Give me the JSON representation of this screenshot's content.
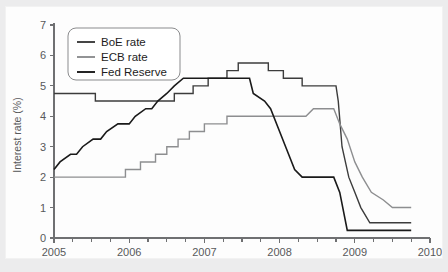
{
  "chart_data": {
    "type": "line",
    "title": "",
    "subtitle": "",
    "xlabel": "",
    "ylabel": "Interest rate (%)",
    "xlim": [
      2005,
      2010
    ],
    "ylim": [
      0,
      7
    ],
    "grid": false,
    "legend_position": "top-left",
    "x_tick_labels": [
      "2005",
      "2006",
      "2007",
      "2008",
      "2009",
      "2010"
    ],
    "x_tick_values": [
      2005,
      2006,
      2007,
      2008,
      2009,
      2010
    ],
    "x_minor_tick_interval": 0.25,
    "y_tick_labels": [
      "0",
      "1",
      "2",
      "3",
      "4",
      "5",
      "6",
      "7"
    ],
    "y_tick_values": [
      0,
      1,
      2,
      3,
      4,
      5,
      6,
      7
    ],
    "series": [
      {
        "name": "BoE rate",
        "color": "#3c3c3c",
        "width": 1.4,
        "points": [
          [
            2005.0,
            4.75
          ],
          [
            2005.55,
            4.75
          ],
          [
            2005.55,
            4.5
          ],
          [
            2006.6,
            4.5
          ],
          [
            2006.6,
            4.75
          ],
          [
            2006.85,
            4.75
          ],
          [
            2006.85,
            5.0
          ],
          [
            2007.05,
            5.0
          ],
          [
            2007.05,
            5.25
          ],
          [
            2007.3,
            5.25
          ],
          [
            2007.3,
            5.5
          ],
          [
            2007.45,
            5.5
          ],
          [
            2007.45,
            5.75
          ],
          [
            2007.85,
            5.75
          ],
          [
            2007.85,
            5.5
          ],
          [
            2008.05,
            5.5
          ],
          [
            2008.05,
            5.25
          ],
          [
            2008.3,
            5.25
          ],
          [
            2008.3,
            5.0
          ],
          [
            2008.75,
            5.0
          ],
          [
            2008.78,
            4.5
          ],
          [
            2008.83,
            3.0
          ],
          [
            2008.92,
            2.0
          ],
          [
            2009.0,
            1.5
          ],
          [
            2009.08,
            1.0
          ],
          [
            2009.2,
            0.5
          ],
          [
            2009.75,
            0.5
          ]
        ]
      },
      {
        "name": "ECB rate",
        "color": "#8d8e90",
        "width": 1.4,
        "points": [
          [
            2005.0,
            2.0
          ],
          [
            2005.95,
            2.0
          ],
          [
            2005.95,
            2.25
          ],
          [
            2006.15,
            2.25
          ],
          [
            2006.15,
            2.5
          ],
          [
            2006.35,
            2.5
          ],
          [
            2006.35,
            2.75
          ],
          [
            2006.5,
            2.75
          ],
          [
            2006.5,
            3.0
          ],
          [
            2006.65,
            3.0
          ],
          [
            2006.65,
            3.25
          ],
          [
            2006.8,
            3.25
          ],
          [
            2006.8,
            3.5
          ],
          [
            2007.0,
            3.5
          ],
          [
            2007.0,
            3.75
          ],
          [
            2007.3,
            3.75
          ],
          [
            2007.3,
            4.0
          ],
          [
            2008.35,
            4.0
          ],
          [
            2008.45,
            4.25
          ],
          [
            2008.72,
            4.25
          ],
          [
            2008.8,
            3.75
          ],
          [
            2008.9,
            3.25
          ],
          [
            2009.0,
            2.5
          ],
          [
            2009.1,
            2.0
          ],
          [
            2009.22,
            1.5
          ],
          [
            2009.38,
            1.25
          ],
          [
            2009.5,
            1.0
          ],
          [
            2009.75,
            1.0
          ]
        ]
      },
      {
        "name": "Fed Reserve",
        "color": "#1a1a1a",
        "width": 1.6,
        "points": [
          [
            2005.0,
            2.25
          ],
          [
            2005.08,
            2.5
          ],
          [
            2005.22,
            2.75
          ],
          [
            2005.3,
            2.75
          ],
          [
            2005.38,
            3.0
          ],
          [
            2005.52,
            3.25
          ],
          [
            2005.62,
            3.25
          ],
          [
            2005.7,
            3.5
          ],
          [
            2005.85,
            3.75
          ],
          [
            2006.0,
            3.75
          ],
          [
            2006.08,
            4.0
          ],
          [
            2006.22,
            4.25
          ],
          [
            2006.3,
            4.25
          ],
          [
            2006.38,
            4.5
          ],
          [
            2006.5,
            4.75
          ],
          [
            2006.6,
            5.0
          ],
          [
            2006.72,
            5.25
          ],
          [
            2007.6,
            5.25
          ],
          [
            2007.65,
            4.75
          ],
          [
            2007.8,
            4.5
          ],
          [
            2007.88,
            4.25
          ],
          [
            2008.0,
            3.5
          ],
          [
            2008.08,
            3.0
          ],
          [
            2008.2,
            2.25
          ],
          [
            2008.3,
            2.0
          ],
          [
            2008.72,
            2.0
          ],
          [
            2008.8,
            1.5
          ],
          [
            2008.9,
            0.25
          ],
          [
            2009.75,
            0.25
          ]
        ]
      }
    ]
  },
  "legend": {
    "entries": [
      {
        "label": "BoE rate"
      },
      {
        "label": "ECB rate"
      },
      {
        "label": "Fed Reserve"
      }
    ]
  }
}
